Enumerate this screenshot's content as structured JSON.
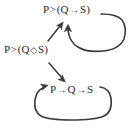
{
  "diagram": {
    "background_color": "#ffffff",
    "stroke_color": "#3a3a3a",
    "text_color": "#2b2b2b",
    "nodes": {
      "source": {
        "id": "source-formula",
        "text": "P>(Q◇S)",
        "parts": {
          "antecedent": "P",
          "operator": ">",
          "open_paren": "(",
          "left": "Q",
          "inner_operator": "◇",
          "right": "S",
          "close_paren": ")"
        }
      },
      "top": {
        "id": "top-formula",
        "text": "P>(Q→S)",
        "parts": {
          "antecedent": "P",
          "operator": ">",
          "open_paren": "(",
          "left": "Q",
          "inner_operator": "→",
          "right": "S",
          "close_paren": ")"
        }
      },
      "bottom": {
        "id": "bottom-formula",
        "text": "P→Q→S",
        "parts": {
          "first": "P",
          "operator_one": "→",
          "second": "Q",
          "operator_two": "→",
          "third": "S"
        }
      }
    },
    "edges": [
      {
        "name": "branch-up-arrow",
        "from": "source-formula",
        "to": "top-formula",
        "style": "straight",
        "direction": "up-right"
      },
      {
        "name": "branch-down-arrow",
        "from": "source-formula",
        "to": "bottom-formula",
        "style": "straight",
        "direction": "down-right"
      },
      {
        "name": "top-self-loop",
        "from": "top-formula",
        "to": "top-formula",
        "style": "rounded-rectangle-loop",
        "direction": "clockwise-return-left"
      },
      {
        "name": "bottom-self-loop",
        "from": "bottom-formula",
        "to": "bottom-formula",
        "style": "rounded-rectangle-loop",
        "direction": "counterclockwise-return-left"
      }
    ]
  }
}
